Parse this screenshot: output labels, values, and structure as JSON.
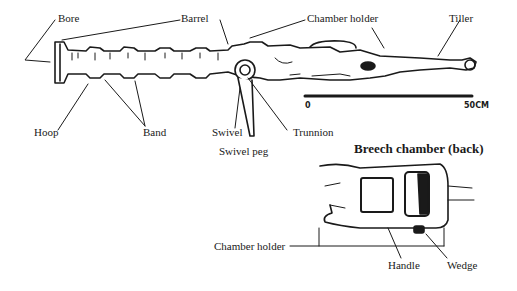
{
  "diagram": {
    "type": "labeled-technical-drawing",
    "labels": {
      "bore": "Bore",
      "barrel": "Barrel",
      "chamber_holder_top": "Chamber holder",
      "tiller": "Tiller",
      "hoop": "Hoop",
      "band": "Band",
      "swivel": "Swivel",
      "swivel_peg": "Swivel peg",
      "trunnion": "Trunnion"
    },
    "scale_bar": {
      "start": "0",
      "end": "50CM"
    },
    "inset": {
      "title": "Breech chamber (back)",
      "labels": {
        "chamber_holder": "Chamber holder",
        "handle": "Handle",
        "wedge": "Wedge"
      }
    }
  },
  "colors": {
    "ink": "#1a1a1a",
    "background": "#ffffff"
  }
}
